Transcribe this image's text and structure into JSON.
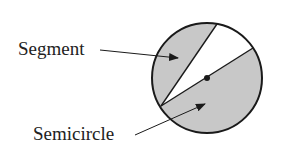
{
  "diagram": {
    "labels": {
      "segment": "Segment",
      "semicircle": "Semicircle"
    },
    "colors": {
      "shade": "#c8c8c8",
      "stroke": "#1a1a1a",
      "background": "#ffffff",
      "text": "#222222"
    },
    "circle": {
      "cx": 207,
      "cy": 78,
      "r": 55
    },
    "center_point": {
      "x": 207,
      "y": 78
    },
    "chords": [
      {
        "name": "segment-chord",
        "from": [
          161,
          106
        ],
        "to": [
          217,
          24
        ]
      },
      {
        "name": "diameter",
        "from": [
          161,
          106
        ],
        "to": [
          253,
          48
        ]
      }
    ]
  }
}
